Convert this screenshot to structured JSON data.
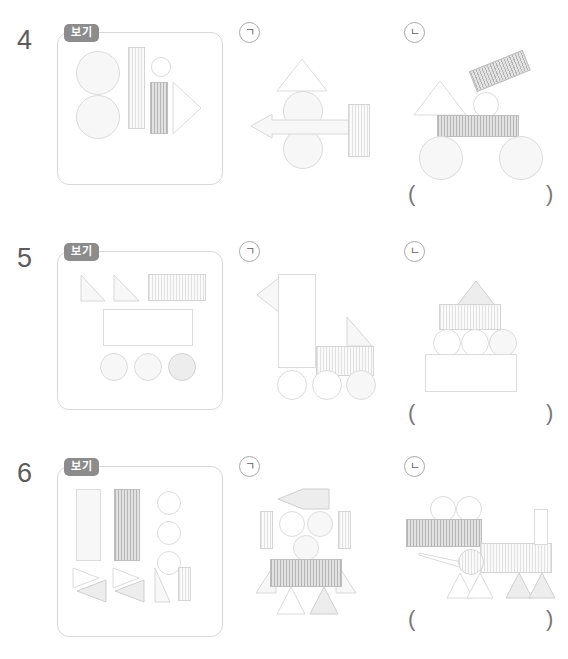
{
  "page": {
    "rows": [
      {
        "number": "4",
        "example_label": "보기",
        "options": [
          {
            "label": "ㄱ",
            "name": "option-giyeok"
          },
          {
            "label": "ㄴ",
            "name": "option-nieun"
          }
        ],
        "answer_open": "(",
        "answer_close": ")",
        "answer_value": "",
        "example_shapes": [
          {
            "kind": "circle",
            "fill": "plain-lite",
            "x": 18,
            "y": 18,
            "w": 44,
            "h": 44
          },
          {
            "kind": "circle",
            "fill": "plain-lite",
            "x": 18,
            "y": 62,
            "w": 44,
            "h": 44
          },
          {
            "kind": "rect",
            "fill": "lite",
            "x": 70,
            "y": 14,
            "w": 17,
            "h": 82
          },
          {
            "kind": "circle",
            "fill": "white",
            "x": 93,
            "y": 24,
            "w": 20,
            "h": 20
          },
          {
            "kind": "rect",
            "fill": "dark",
            "x": 92,
            "y": 49,
            "w": 18,
            "h": 52
          },
          {
            "kind": "triangle-right",
            "fill": "white",
            "x": 114,
            "y": 48,
            "w": 30,
            "h": 54
          }
        ],
        "option_a_shapes": [
          {
            "kind": "triangle-up",
            "fill": "white",
            "x": 36,
            "y": 14,
            "w": 52,
            "h": 33
          },
          {
            "kind": "circle",
            "fill": "plain-lite",
            "x": 43,
            "y": 47,
            "w": 40,
            "h": 40
          },
          {
            "kind": "circle",
            "fill": "plain-lite",
            "x": 43,
            "y": 85,
            "w": 40,
            "h": 40
          },
          {
            "kind": "arrow-left",
            "fill": "lite",
            "x": 10,
            "y": 70,
            "w": 100,
            "h": 24
          },
          {
            "kind": "rect",
            "fill": "lite",
            "x": 108,
            "y": 60,
            "w": 22,
            "h": 53
          }
        ],
        "option_b_shapes": [
          {
            "kind": "triangle-up",
            "fill": "white",
            "x": 8,
            "y": 40,
            "w": 52,
            "h": 35
          },
          {
            "kind": "rect-rot",
            "fill": "dark",
            "x": 72,
            "y": 30,
            "w": 58,
            "h": 22,
            "rot": -22
          },
          {
            "kind": "circle",
            "fill": "white",
            "x": 68,
            "y": 52,
            "w": 26,
            "h": 26
          },
          {
            "kind": "rect",
            "fill": "dark",
            "x": 32,
            "y": 75,
            "w": 82,
            "h": 22
          },
          {
            "kind": "circle",
            "fill": "plain-lite",
            "x": 14,
            "y": 96,
            "w": 44,
            "h": 44
          },
          {
            "kind": "circle",
            "fill": "plain-lite",
            "x": 94,
            "y": 96,
            "w": 44,
            "h": 44
          }
        ]
      },
      {
        "number": "5",
        "example_label": "보기",
        "options": [
          {
            "label": "ㄱ",
            "name": "option-giyeok"
          },
          {
            "label": "ㄴ",
            "name": "option-nieun"
          }
        ],
        "answer_open": "(",
        "answer_close": ")",
        "answer_value": "",
        "example_shapes": [
          {
            "kind": "triangle-rt",
            "fill": "lite",
            "x": 22,
            "y": 22,
            "w": 24,
            "h": 27
          },
          {
            "kind": "triangle-rt",
            "fill": "lite",
            "x": 55,
            "y": 22,
            "w": 26,
            "h": 27
          },
          {
            "kind": "rect",
            "fill": "lite",
            "x": 90,
            "y": 22,
            "w": 58,
            "h": 27
          },
          {
            "kind": "rect",
            "fill": "white",
            "x": 45,
            "y": 57,
            "w": 90,
            "h": 37
          },
          {
            "kind": "circle",
            "fill": "plain-lite",
            "x": 42,
            "y": 101,
            "w": 28,
            "h": 28
          },
          {
            "kind": "circle",
            "fill": "plain-lite",
            "x": 76,
            "y": 101,
            "w": 28,
            "h": 28
          },
          {
            "kind": "circle",
            "fill": "plain-mid",
            "x": 110,
            "y": 101,
            "w": 28,
            "h": 28
          }
        ],
        "option_a_shapes": [
          {
            "kind": "triangle-left",
            "fill": "lite",
            "x": 13,
            "y": 18,
            "w": 24,
            "h": 36
          },
          {
            "kind": "rect",
            "fill": "white",
            "x": 35,
            "y": 16,
            "w": 38,
            "h": 94
          },
          {
            "kind": "triangle-rt-flip",
            "fill": "lite",
            "x": 103,
            "y": 60,
            "w": 25,
            "h": 29
          },
          {
            "kind": "rect",
            "fill": "lite",
            "x": 73,
            "y": 88,
            "w": 58,
            "h": 30
          },
          {
            "kind": "circle",
            "fill": "white",
            "x": 34,
            "y": 112,
            "w": 30,
            "h": 30
          },
          {
            "kind": "circle",
            "fill": "white",
            "x": 69,
            "y": 112,
            "w": 30,
            "h": 30
          },
          {
            "kind": "circle",
            "fill": "plain-lite",
            "x": 103,
            "y": 112,
            "w": 30,
            "h": 30
          }
        ],
        "option_b_shapes": [
          {
            "kind": "triangle-up",
            "fill": "mid",
            "x": 47,
            "y": 23,
            "w": 42,
            "h": 28
          },
          {
            "kind": "rect",
            "fill": "lite",
            "x": 32,
            "y": 46,
            "w": 62,
            "h": 26
          },
          {
            "kind": "circle",
            "fill": "white",
            "x": 26,
            "y": 71,
            "w": 28,
            "h": 28
          },
          {
            "kind": "circle",
            "fill": "white",
            "x": 54,
            "y": 71,
            "w": 28,
            "h": 28
          },
          {
            "kind": "circle",
            "fill": "plain-lite",
            "x": 82,
            "y": 71,
            "w": 28,
            "h": 28
          },
          {
            "kind": "rect",
            "fill": "white",
            "x": 18,
            "y": 96,
            "w": 92,
            "h": 38
          }
        ]
      },
      {
        "number": "6",
        "example_label": "보기",
        "options": [
          {
            "label": "ㄱ",
            "name": "option-giyeok"
          },
          {
            "label": "ㄴ",
            "name": "option-nieun"
          }
        ],
        "answer_open": "(",
        "answer_close": ")",
        "answer_value": "",
        "example_shapes": [
          {
            "kind": "rect",
            "fill": "plain-lite",
            "x": 18,
            "y": 10,
            "w": 25,
            "h": 72
          },
          {
            "kind": "rect",
            "fill": "dark",
            "x": 56,
            "y": 10,
            "w": 26,
            "h": 72
          },
          {
            "kind": "circle",
            "fill": "white",
            "x": 99,
            "y": 12,
            "w": 24,
            "h": 24
          },
          {
            "kind": "circle",
            "fill": "white",
            "x": 99,
            "y": 42,
            "w": 24,
            "h": 24
          },
          {
            "kind": "circle",
            "fill": "white",
            "x": 99,
            "y": 72,
            "w": 24,
            "h": 24
          },
          {
            "kind": "triangle-right",
            "fill": "white",
            "x": 14,
            "y": 88,
            "w": 26,
            "h": 20
          },
          {
            "kind": "triangle-left",
            "fill": "mid",
            "x": 18,
            "y": 100,
            "w": 30,
            "h": 22
          },
          {
            "kind": "triangle-right",
            "fill": "white",
            "x": 54,
            "y": 88,
            "w": 26,
            "h": 20
          },
          {
            "kind": "triangle-left",
            "fill": "mid",
            "x": 56,
            "y": 100,
            "w": 30,
            "h": 22
          },
          {
            "kind": "triangle-thin",
            "fill": "lite",
            "x": 96,
            "y": 88,
            "w": 16,
            "h": 34
          },
          {
            "kind": "rect",
            "fill": "lite",
            "x": 120,
            "y": 88,
            "w": 13,
            "h": 34
          }
        ],
        "option_a_shapes": [
          {
            "kind": "kite-left",
            "fill": "mid",
            "x": 34,
            "y": 15,
            "w": 52,
            "h": 20
          },
          {
            "kind": "rect",
            "fill": "lite",
            "x": 17,
            "y": 38,
            "w": 13,
            "h": 38
          },
          {
            "kind": "rect",
            "fill": "lite",
            "x": 95,
            "y": 38,
            "w": 13,
            "h": 38
          },
          {
            "kind": "circle",
            "fill": "white",
            "x": 36,
            "y": 38,
            "w": 26,
            "h": 26
          },
          {
            "kind": "circle",
            "fill": "plain-lite",
            "x": 64,
            "y": 38,
            "w": 26,
            "h": 26
          },
          {
            "kind": "circle",
            "fill": "plain-lite",
            "x": 50,
            "y": 62,
            "w": 26,
            "h": 26
          },
          {
            "kind": "triangle-rt-flip",
            "fill": "lite",
            "x": 12,
            "y": 88,
            "w": 20,
            "h": 32
          },
          {
            "kind": "triangle-rt",
            "fill": "lite",
            "x": 94,
            "y": 88,
            "w": 20,
            "h": 32
          },
          {
            "kind": "rect",
            "fill": "dark",
            "x": 27,
            "y": 86,
            "w": 72,
            "h": 28
          },
          {
            "kind": "triangle-up",
            "fill": "white",
            "x": 33,
            "y": 115,
            "w": 28,
            "h": 28
          },
          {
            "kind": "triangle-up",
            "fill": "mid",
            "x": 68,
            "y": 115,
            "w": 28,
            "h": 28
          }
        ],
        "option_b_shapes": [
          {
            "kind": "circle",
            "fill": "white",
            "x": 30,
            "y": 23,
            "w": 26,
            "h": 26
          },
          {
            "kind": "circle",
            "fill": "white",
            "x": 56,
            "y": 23,
            "w": 26,
            "h": 26
          },
          {
            "kind": "rect",
            "fill": "dark",
            "x": 6,
            "y": 46,
            "w": 76,
            "h": 28
          },
          {
            "kind": "rect",
            "fill": "lite",
            "x": 80,
            "y": 70,
            "w": 72,
            "h": 30
          },
          {
            "kind": "rect",
            "fill": "white",
            "x": 134,
            "y": 36,
            "w": 14,
            "h": 36
          },
          {
            "kind": "circle",
            "fill": "lite",
            "x": 58,
            "y": 76,
            "w": 26,
            "h": 26
          },
          {
            "kind": "wedge-left",
            "fill": "white",
            "x": 18,
            "y": 80,
            "w": 48,
            "h": 16
          },
          {
            "kind": "triangle-up",
            "fill": "white",
            "x": 46,
            "y": 100,
            "w": 26,
            "h": 26
          },
          {
            "kind": "triangle-up",
            "fill": "white",
            "x": 66,
            "y": 100,
            "w": 26,
            "h": 26
          },
          {
            "kind": "triangle-up",
            "fill": "mid",
            "x": 105,
            "y": 100,
            "w": 26,
            "h": 26
          },
          {
            "kind": "triangle-up",
            "fill": "mid",
            "x": 128,
            "y": 100,
            "w": 26,
            "h": 26
          }
        ]
      }
    ]
  },
  "colors": {
    "badge_bg": "#8c8c8c",
    "badge_text": "#ffffff",
    "box_border": "#d8d8d8",
    "text": "#5c5c5c",
    "shape_light": "#fafafa",
    "shape_mid": "#ededed",
    "shape_dark": "#e2e2e2"
  }
}
